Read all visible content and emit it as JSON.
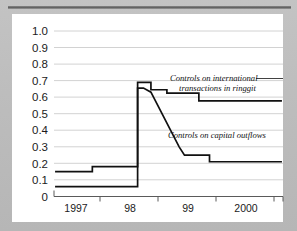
{
  "figure": {
    "background_color": "#bdbdbd",
    "card_color": "#ffffff",
    "rule_color": "#5e5e5e",
    "line_color": "#111111",
    "grid_color": "#d2d2d2"
  },
  "chart_data": {
    "type": "line",
    "title": "",
    "xlabel": "",
    "ylabel": "",
    "grid": true,
    "legend_position": "inline-annotation",
    "ylim": [
      0,
      1.0
    ],
    "xlim": [
      1996.6,
      2000.9
    ],
    "yticks": [
      0,
      0.1,
      0.2,
      0.3,
      0.4,
      0.5,
      0.6,
      0.7,
      0.8,
      0.9,
      1.0
    ],
    "ytick_labels": [
      "0",
      "0.1",
      "0.2",
      "0.3",
      "0.4",
      "0.5",
      "0.6",
      "0.7",
      "0.8",
      "0.9",
      "1.0"
    ],
    "xticks": [
      1997.0,
      1998.0,
      1999.0,
      2000.0
    ],
    "xtick_labels": [
      "1997",
      "98",
      "99",
      "2000"
    ],
    "series": [
      {
        "name": "Controls on international transactions in ringgit",
        "annotation": "Controls on international transactions in ringgit",
        "x": [
          1996.62,
          1997.32,
          1997.32,
          1998.17,
          1998.17,
          1998.32,
          1998.42,
          1998.42,
          1998.62,
          1998.72,
          1998.72,
          1999.22,
          1999.32,
          1999.32,
          2000.88
        ],
        "y": [
          0.15,
          0.15,
          0.18,
          0.18,
          0.69,
          0.69,
          0.69,
          0.645,
          0.645,
          0.645,
          0.625,
          0.625,
          0.625,
          0.578,
          0.578
        ]
      },
      {
        "name": "Controls on capital outflows",
        "annotation": "Controls on capital outflows",
        "x": [
          1996.62,
          1998.17,
          1998.17,
          1998.28,
          1998.42,
          1998.95,
          1999.05,
          1999.05,
          1999.42,
          1999.52,
          1999.52,
          2000.88
        ],
        "y": [
          0.06,
          0.06,
          0.655,
          0.655,
          0.63,
          0.3,
          0.25,
          0.25,
          0.25,
          0.25,
          0.21,
          0.21
        ]
      }
    ],
    "annotations": [
      {
        "text_line_1": "Controls on international",
        "text_line_2": "transactions in ringgit",
        "anchor_x": 1998.58,
        "anchor_y": 0.76
      },
      {
        "text_line_1": "Controls on capital outflows",
        "text_line_2": "",
        "anchor_x": 1998.62,
        "anchor_y": 0.375
      }
    ]
  }
}
